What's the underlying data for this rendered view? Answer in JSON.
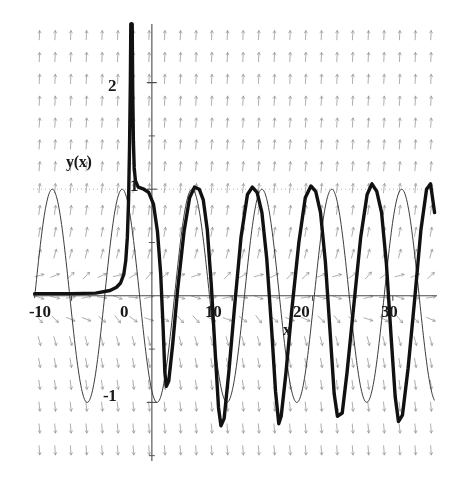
{
  "figure": {
    "kind": "slope-field-with-solution-curves",
    "background": "#ffffff",
    "ink": "#1a1a1a",
    "field_color": "#8a8a8a"
  },
  "labels": {
    "y_axis_name": "y(x)",
    "x_axis_name": "x"
  },
  "axes": {
    "x_ticks": [
      {
        "value": -10,
        "label": "-10"
      },
      {
        "value": 0,
        "label": "0"
      },
      {
        "value": 10,
        "label": "10"
      },
      {
        "value": 20,
        "label": "20"
      },
      {
        "value": 30,
        "label": "30"
      }
    ],
    "y_ticks": [
      {
        "value": 2,
        "label": "2"
      },
      {
        "value": 1,
        "label": "1"
      },
      {
        "value": -1,
        "label": "-1"
      }
    ],
    "xlim": [
      -14.8,
      35.5
    ],
    "ylim": [
      -1.55,
      2.55
    ],
    "x_minor_step": 2,
    "y_minor_step": 0.5,
    "grid": false
  },
  "chart_data": {
    "type": "line",
    "title": "",
    "xlabel": "x",
    "ylabel": "y(x)",
    "xlim": [
      -14.8,
      35.5
    ],
    "ylim": [
      -1.55,
      2.55
    ],
    "grid": false,
    "legend": null,
    "slope_field": {
      "description": "arrows of a direction field dy/dx; nearly vertical pointing up above y=0 and down below y=0, tilting toward the horizontal near y=0",
      "x_start": -14.0,
      "x_step": 1.95,
      "x_count": 26,
      "y_start": -1.45,
      "y_step": 0.205,
      "y_count": 20,
      "color": "#8f8f8f"
    },
    "series": [
      {
        "name": "thin-solution-curve",
        "style": "thin",
        "linewidth": 1,
        "color": "#333333",
        "description": "oscillating sinusoid of unit amplitude spanning the whole window, period about 8.7",
        "amplitude": 1.0,
        "period": 8.7,
        "phase_peak_x": -12.4,
        "offset": 0.0,
        "x_from": -14.6,
        "x_to": 35.2
      },
      {
        "name": "thick-solution-curve",
        "style": "thick",
        "linewidth": 3.4,
        "color": "#111111",
        "description": "solution that blows up near x=-2.6 on the left, comes down from above the top of the frame, settles onto a clipped oscillation of amplitude near 1 that lags the thin curve",
        "blowup_x": -2.55,
        "x_from": -14.6,
        "x_to": 35.2,
        "points": [
          [
            -14.6,
            0.02
          ],
          [
            -10.0,
            0.02
          ],
          [
            -7.0,
            0.025
          ],
          [
            -5.2,
            0.05
          ],
          [
            -4.4,
            0.08
          ],
          [
            -3.9,
            0.12
          ],
          [
            -3.5,
            0.2
          ],
          [
            -3.25,
            0.33
          ],
          [
            -3.05,
            0.55
          ],
          [
            -2.9,
            0.9
          ],
          [
            -2.78,
            1.4
          ],
          [
            -2.68,
            2.0
          ],
          [
            -2.62,
            2.55
          ],
          [
            -2.45,
            2.55
          ],
          [
            -2.38,
            1.9
          ],
          [
            -2.3,
            1.45
          ],
          [
            -2.2,
            1.2
          ],
          [
            -2.05,
            1.08
          ],
          [
            -1.7,
            1.02
          ],
          [
            -1.0,
            1.0
          ],
          [
            -0.4,
            0.97
          ],
          [
            0.2,
            0.86
          ],
          [
            0.7,
            0.6
          ],
          [
            1.1,
            0.2
          ],
          [
            1.4,
            -0.3
          ],
          [
            1.62,
            -0.72
          ],
          [
            1.8,
            -0.85
          ],
          [
            2.1,
            -0.8
          ],
          [
            2.6,
            -0.45
          ],
          [
            3.2,
            0.05
          ],
          [
            4.0,
            0.6
          ],
          [
            4.7,
            0.92
          ],
          [
            5.3,
            1.02
          ],
          [
            5.9,
            1.0
          ],
          [
            6.4,
            0.9
          ],
          [
            6.9,
            0.62
          ],
          [
            7.4,
            0.1
          ],
          [
            7.9,
            -0.55
          ],
          [
            8.3,
            -1.05
          ],
          [
            8.6,
            -1.22
          ],
          [
            9.0,
            -1.15
          ],
          [
            9.6,
            -0.7
          ],
          [
            10.3,
            -0.1
          ],
          [
            11.1,
            0.55
          ],
          [
            11.9,
            0.95
          ],
          [
            12.5,
            1.02
          ],
          [
            13.1,
            0.97
          ],
          [
            13.7,
            0.78
          ],
          [
            14.3,
            0.35
          ],
          [
            14.9,
            -0.3
          ],
          [
            15.4,
            -0.9
          ],
          [
            15.8,
            -1.2
          ],
          [
            16.1,
            -1.13
          ],
          [
            16.7,
            -0.72
          ],
          [
            17.4,
            -0.15
          ],
          [
            18.3,
            0.5
          ],
          [
            19.1,
            0.92
          ],
          [
            19.8,
            1.03
          ],
          [
            20.4,
            0.98
          ],
          [
            21.0,
            0.78
          ],
          [
            21.6,
            0.32
          ],
          [
            22.2,
            -0.35
          ],
          [
            22.7,
            -0.92
          ],
          [
            23.1,
            -1.13
          ],
          [
            23.7,
            -1.1
          ],
          [
            24.3,
            -0.72
          ],
          [
            25.1,
            -0.12
          ],
          [
            26.0,
            0.55
          ],
          [
            26.8,
            0.95
          ],
          [
            27.4,
            1.05
          ],
          [
            28.0,
            0.98
          ],
          [
            28.6,
            0.78
          ],
          [
            29.2,
            0.3
          ],
          [
            29.8,
            -0.4
          ],
          [
            30.3,
            -0.95
          ],
          [
            30.7,
            -1.18
          ],
          [
            31.2,
            -1.12
          ],
          [
            31.9,
            -0.68
          ],
          [
            32.7,
            -0.05
          ],
          [
            33.5,
            0.62
          ],
          [
            34.2,
            1.0
          ],
          [
            34.7,
            1.05
          ],
          [
            35.2,
            0.78
          ]
        ]
      }
    ]
  }
}
